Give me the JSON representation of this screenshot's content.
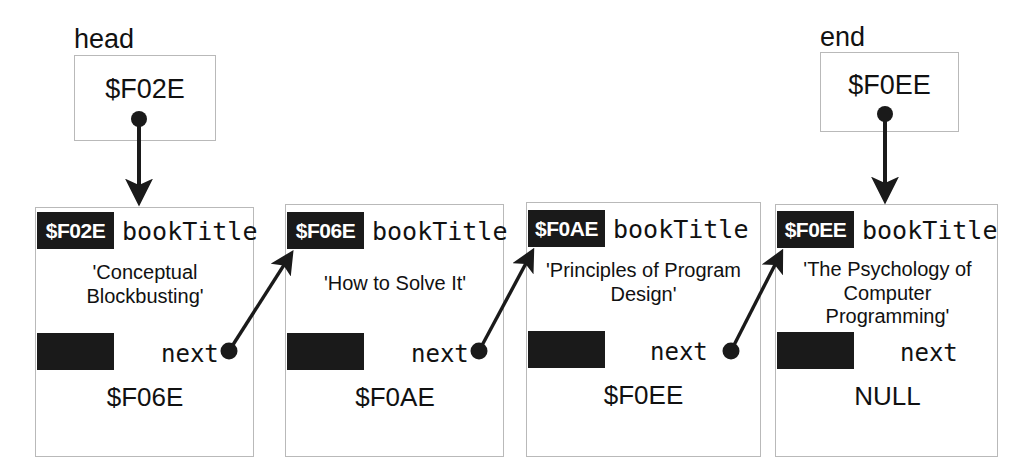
{
  "diagram": {
    "colors": {
      "ink": "#111111",
      "block_fill": "#1a1a1a",
      "card_border": "#b9b9b9",
      "background": "#ffffff"
    }
  },
  "pointers": [
    {
      "id": "head",
      "label": "head",
      "value": "$F02E"
    },
    {
      "id": "end",
      "label": "end",
      "value": "$F0EE"
    }
  ],
  "field_labels": {
    "book_title": "bookTitle",
    "next": "next"
  },
  "nodes": [
    {
      "address": "$F02E",
      "title_field": "bookTitle",
      "title_value": "'Conceptual\nBlockbusting'",
      "next_field": "next",
      "next_value": "$F06E",
      "has_next_pointer": true
    },
    {
      "address": "$F06E",
      "title_field": "bookTitle",
      "title_value": "'How to Solve It'",
      "next_field": "next",
      "next_value": "$F0AE",
      "has_next_pointer": true
    },
    {
      "address": "$F0AE",
      "title_field": "bookTitle",
      "title_value": "'Principles of Program\nDesign'",
      "next_field": "next",
      "next_value": "$F0EE",
      "has_next_pointer": true
    },
    {
      "address": "$F0EE",
      "title_field": "bookTitle",
      "title_value": "'The Psychology of\nComputer\nProgramming'",
      "next_field": "next",
      "next_value": "NULL",
      "has_next_pointer": false
    }
  ],
  "connections": [
    {
      "from": "head",
      "to": "$F02E",
      "kind": "vertical"
    },
    {
      "from": "end",
      "to": "$F0EE",
      "kind": "vertical"
    },
    {
      "from": "$F02E.next",
      "to": "$F06E",
      "kind": "diagonal"
    },
    {
      "from": "$F06E.next",
      "to": "$F0AE",
      "kind": "diagonal"
    },
    {
      "from": "$F0AE.next",
      "to": "$F0EE",
      "kind": "diagonal"
    }
  ]
}
